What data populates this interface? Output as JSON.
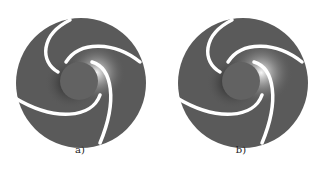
{
  "figures": [
    {
      "id": "a",
      "label": "a)"
    },
    {
      "id": "b",
      "label": "b)"
    }
  ],
  "colors": {
    "background": "#ffffff",
    "disc": "#5a5a5a",
    "hub": "#606060",
    "blade": "#ffffff",
    "highlight": "#f0f0f0",
    "shadow": "#1e1e1e"
  }
}
